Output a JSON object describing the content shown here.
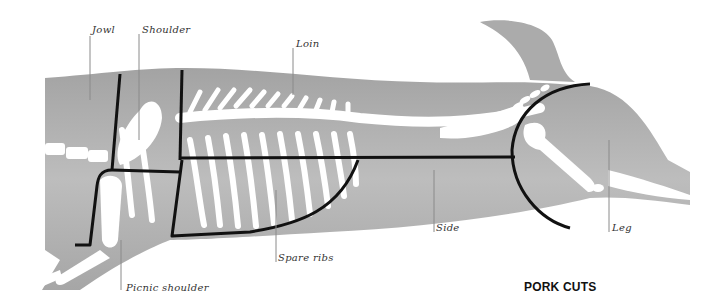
{
  "title": "PORK CUTS",
  "labels": {
    "jowl": "Jowl",
    "shoulder": "Shoulder",
    "loin": "Loin",
    "picnic_shoulder": "Picnic shoulder",
    "spare_ribs": "Spare ribs",
    "side": "Side",
    "leg": "Leg"
  },
  "colors": {
    "body": "#a9a9a9",
    "body_light": "#c4c4c4",
    "bone": "#ffffff",
    "cut_line": "#111111",
    "leader_line": "#888888",
    "text": "#333333"
  }
}
